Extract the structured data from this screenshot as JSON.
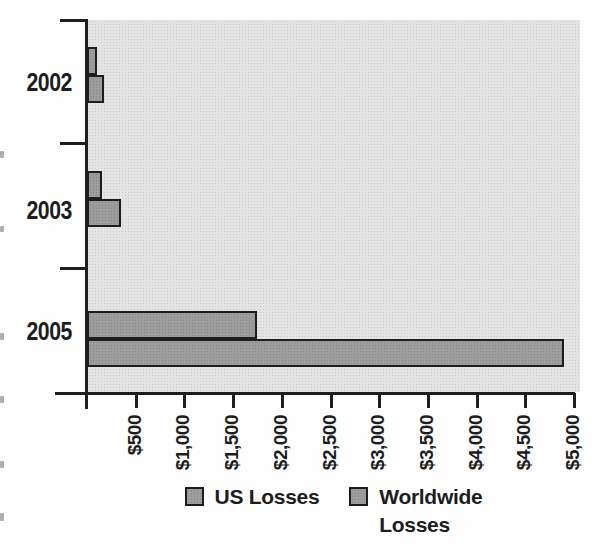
{
  "chart_data": {
    "type": "bar",
    "orientation": "horizontal",
    "title": "",
    "xlabel": "",
    "ylabel": "",
    "categories": [
      "2002",
      "2003",
      "2005"
    ],
    "series": [
      {
        "name": "US Losses",
        "values": [
          100,
          150,
          1750
        ],
        "color": "#9d9d9d"
      },
      {
        "name": "Worldwide Losses",
        "values": [
          175,
          350,
          4900
        ],
        "color": "#9d9d9d"
      }
    ],
    "values_unit": "$ (millions shown with $ prefix on axis)",
    "xlim": [
      0,
      5000
    ],
    "x_tick_interval": 500,
    "x_tick_labels": [
      "$500",
      "$1,000",
      "$1,500",
      "$2,000",
      "$2,500",
      "$3,000",
      "$3,500",
      "$4,000",
      "$4,500",
      "$5,000"
    ],
    "tick_label_rotation_deg": 90,
    "grid": false,
    "legend_position": "bottom",
    "legend": {
      "items": [
        {
          "lines": [
            "US Losses"
          ]
        },
        {
          "lines": [
            "Worldwide",
            "Losses"
          ]
        }
      ]
    },
    "colors": {
      "plot_background": "#e4e4e4",
      "bar_fill": "#9d9d9d",
      "bar_border": "#1d1d1d",
      "axis": "#1d1d1d",
      "text": "#1d1d1d"
    }
  }
}
